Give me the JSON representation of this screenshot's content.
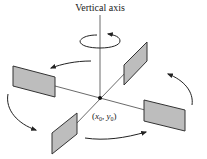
{
  "diagram": {
    "title": "Vertical axis",
    "center_label": {
      "x_var": "x",
      "x_sub": "0",
      "y_var": "y",
      "y_sub": "0"
    },
    "colors": {
      "panel_fill": "#bdbdbd",
      "panel_stroke": "#333333",
      "line": "#444444",
      "arrow": "#222222"
    },
    "panels": [
      {
        "name": "left-panel"
      },
      {
        "name": "top-right-panel"
      },
      {
        "name": "right-panel"
      },
      {
        "name": "bottom-left-panel"
      }
    ],
    "rotation_direction": "counterclockwise"
  }
}
